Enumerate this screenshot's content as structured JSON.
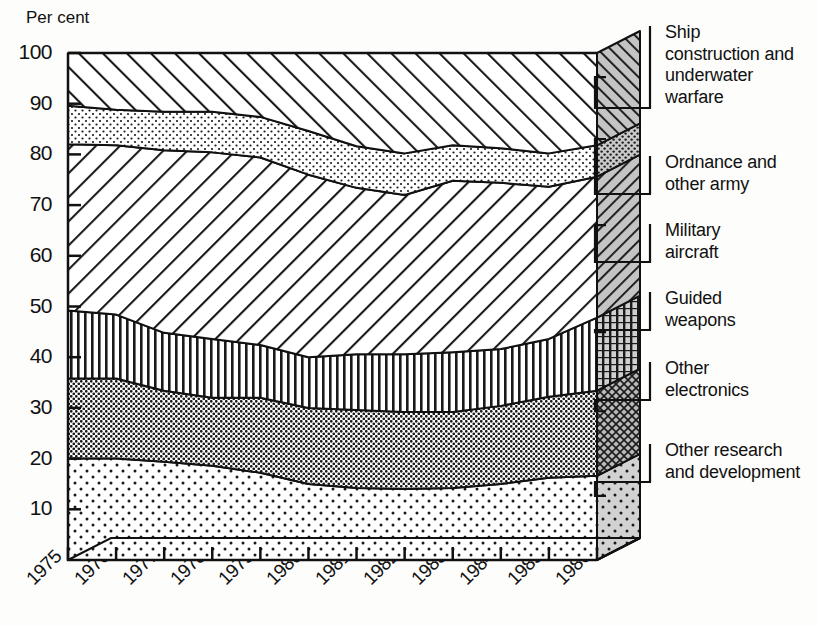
{
  "chart_data": {
    "type": "area",
    "title": "",
    "subtitle": "",
    "xlabel": "",
    "ylabel": "Per cent",
    "ylim": [
      0,
      100
    ],
    "yticks": [
      0,
      10,
      20,
      30,
      40,
      50,
      60,
      70,
      80,
      90,
      100
    ],
    "ytick_labels": [
      "0",
      "10",
      "20",
      "30",
      "40",
      "50",
      "60",
      "70",
      "80",
      "90",
      "100"
    ],
    "grid": false,
    "legend_position": "right",
    "stacked": true,
    "stack_order": "bottom-to-top",
    "categories": [
      "1975",
      "1976",
      "1977",
      "1978",
      "1979",
      "1980",
      "1981",
      "1982",
      "1983",
      "1984",
      "1985",
      "1986"
    ],
    "x": [
      "1975",
      "1976",
      "1977",
      "1978",
      "1979",
      "1980",
      "1981",
      "1982",
      "1983",
      "1984",
      "1985",
      "1986"
    ],
    "series": [
      {
        "name": "Other research and development",
        "key": "other-research-and-development",
        "pattern": "sparse-dots",
        "values": [
          20.0,
          20.0,
          19.4,
          18.6,
          17.2,
          15.0,
          14.2,
          14.0,
          14.2,
          15.0,
          16.2,
          16.6
        ]
      },
      {
        "name": "Other electronics",
        "key": "other-electronics",
        "pattern": "dense-dots",
        "values": [
          15.8,
          15.8,
          14.0,
          13.4,
          14.8,
          15.0,
          15.4,
          15.2,
          15.0,
          15.4,
          16.0,
          16.8
        ]
      },
      {
        "name": "Guided weapons",
        "key": "guided-weapons",
        "pattern": "vertical-lines",
        "values": [
          13.4,
          12.6,
          11.4,
          11.6,
          10.4,
          10.0,
          11.0,
          11.4,
          11.8,
          11.2,
          11.4,
          14.4
        ]
      },
      {
        "name": "Military aircraft",
        "key": "military-aircraft",
        "pattern": "diagonal-lines-left",
        "values": [
          32.8,
          33.4,
          36.0,
          36.8,
          37.0,
          36.0,
          32.8,
          31.4,
          33.8,
          32.8,
          30.0,
          27.8
        ]
      },
      {
        "name": "Ordnance and other army",
        "key": "ordnance-and-other-army",
        "pattern": "medium-dots",
        "values": [
          7.6,
          7.0,
          7.6,
          8.0,
          8.0,
          8.6,
          8.2,
          8.2,
          7.0,
          6.8,
          6.6,
          6.2
        ]
      },
      {
        "name": "Ship construction and underwater warfare",
        "key": "ship-construction-and-underwater-warfare",
        "pattern": "diagonal-lines-right",
        "values": [
          10.4,
          11.2,
          11.6,
          11.6,
          12.6,
          15.4,
          18.4,
          19.8,
          18.2,
          18.8,
          19.8,
          18.2
        ]
      }
    ],
    "cumulative_tops": {
      "other-research-and-development": [
        20.0,
        20.0,
        19.4,
        18.6,
        17.2,
        15.0,
        14.2,
        14.0,
        14.2,
        15.0,
        16.2,
        16.6
      ],
      "other-electronics": [
        35.8,
        35.8,
        33.4,
        32.0,
        32.0,
        30.0,
        29.6,
        29.2,
        29.2,
        30.4,
        32.2,
        33.4
      ],
      "guided-weapons": [
        49.2,
        48.4,
        44.8,
        43.6,
        42.4,
        40.0,
        40.6,
        40.6,
        41.0,
        41.6,
        43.6,
        47.8
      ],
      "military-aircraft": [
        82.0,
        81.8,
        80.8,
        80.4,
        79.4,
        76.0,
        73.4,
        72.0,
        74.8,
        74.4,
        73.6,
        75.6
      ],
      "ordnance-and-other-army": [
        89.6,
        88.8,
        88.4,
        88.4,
        87.4,
        84.6,
        81.6,
        80.2,
        81.8,
        81.2,
        80.2,
        81.8
      ],
      "ship-construction-and-underwater-warfare": [
        100,
        100,
        100,
        100,
        100,
        100,
        100,
        100,
        100,
        100,
        100,
        100
      ]
    }
  },
  "axis": {
    "y_title": "Per cent"
  },
  "legend": {
    "items": [
      {
        "label": "Ship\nconstruction and\nunderwater\nwarfare",
        "key": "ship-construction-and-underwater-warfare"
      },
      {
        "label": "Ordnance and\nother army",
        "key": "ordnance-and-other-army"
      },
      {
        "label": "Military\naircraft",
        "key": "military-aircraft"
      },
      {
        "label": "Guided\nweapons",
        "key": "guided-weapons"
      },
      {
        "label": "Other\nelectronics",
        "key": "other-electronics"
      },
      {
        "label": "Other research\nand development",
        "key": "other-research-and-development"
      }
    ]
  },
  "colors": {
    "ink": "#111111",
    "paper": "#fdfdfb",
    "fill_light": "#ffffff",
    "fill_mid": "#e2e2e2",
    "fill_dark": "#9a9a9a",
    "side_tint": "#c9c9c9"
  }
}
